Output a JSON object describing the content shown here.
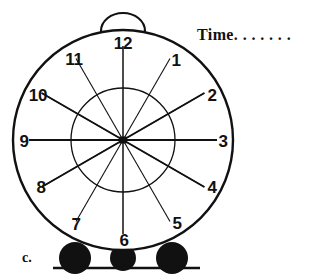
{
  "worksheet": {
    "item_label": "c.",
    "answer_prompt": "Time. . . . . . .",
    "answer_prompt_word": "Time",
    "answer_dots": ". . . . . . ."
  },
  "clock": {
    "name": "alarm-clock-face",
    "center": {
      "x": 123,
      "y": 140
    },
    "outer_radius": 110,
    "inner_radius": 52,
    "hub_size": 7,
    "stroke_color": "#111111",
    "fill_color": "#ffffff",
    "foot_color": "#111111",
    "handle": {
      "cx": 123,
      "cy": 31,
      "rx": 22,
      "ry": 18
    },
    "ground_line": {
      "x1": 53,
      "y1": 268,
      "x2": 200,
      "y2": 268
    },
    "feet": [
      {
        "name": "foot-left",
        "cx": 75,
        "cy": 258,
        "r": 16
      },
      {
        "name": "foot-middle",
        "cx": 123,
        "cy": 258,
        "r": 13
      },
      {
        "name": "foot-right",
        "cx": 172,
        "cy": 258,
        "r": 16
      }
    ],
    "hour_numbers": [
      {
        "value": "12",
        "angle": 0,
        "label_x": 123,
        "label_y": 43
      },
      {
        "value": "1",
        "angle": 30,
        "label_x": 176,
        "label_y": 60
      },
      {
        "value": "2",
        "angle": 60,
        "label_x": 212,
        "label_y": 95
      },
      {
        "value": "3",
        "angle": 90,
        "label_x": 223,
        "label_y": 141
      },
      {
        "value": "4",
        "angle": 120,
        "label_x": 212,
        "label_y": 187
      },
      {
        "value": "5",
        "angle": 150,
        "label_x": 177,
        "label_y": 223
      },
      {
        "value": "6",
        "angle": 180,
        "label_x": 124,
        "label_y": 240
      },
      {
        "value": "7",
        "angle": 210,
        "label_x": 76,
        "label_y": 224
      },
      {
        "value": "8",
        "angle": 240,
        "label_x": 41,
        "label_y": 187
      },
      {
        "value": "9",
        "angle": 270,
        "label_x": 24,
        "label_y": 141
      },
      {
        "value": "10",
        "angle": 300,
        "label_x": 38,
        "label_y": 95
      },
      {
        "value": "11",
        "angle": 330,
        "label_x": 74,
        "label_y": 59
      }
    ]
  }
}
